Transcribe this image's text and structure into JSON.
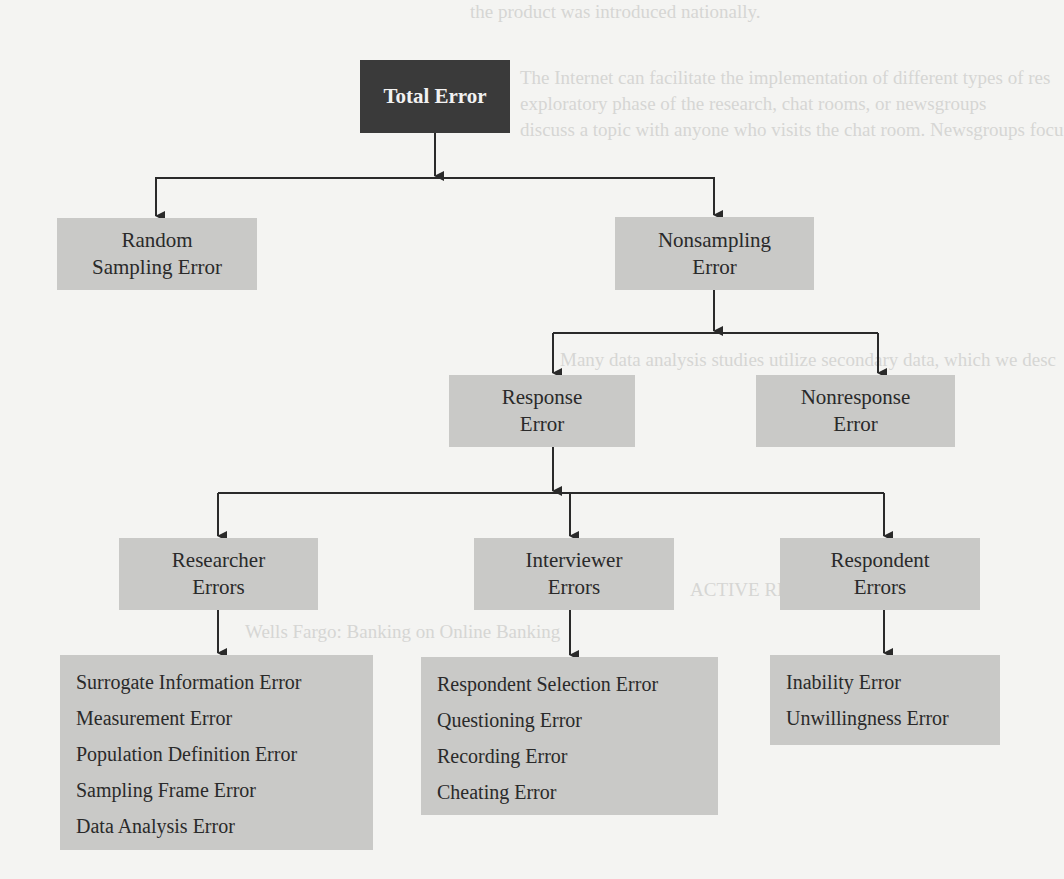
{
  "diagram": {
    "type": "hierarchy",
    "colors": {
      "root_fill": "#3a3a3a",
      "node_fill": "#c9c9c7",
      "line": "#2a2a2a",
      "background": "#f4f4f2"
    },
    "root": {
      "label": "Total Error"
    },
    "level1": [
      {
        "line1": "Random",
        "line2": "Sampling Error"
      },
      {
        "line1": "Nonsampling",
        "line2": "Error"
      }
    ],
    "level2": [
      {
        "line1": "Response",
        "line2": "Error"
      },
      {
        "line1": "Nonresponse",
        "line2": "Error"
      }
    ],
    "level3": [
      {
        "line1": "Researcher",
        "line2": "Errors"
      },
      {
        "line1": "Interviewer",
        "line2": "Errors"
      },
      {
        "line1": "Respondent",
        "line2": "Errors"
      }
    ],
    "lists": {
      "researcher": [
        "Surrogate Information Error",
        "Measurement Error",
        "Population Definition Error",
        "Sampling Frame Error",
        "Data Analysis Error"
      ],
      "interviewer": [
        "Respondent Selection Error",
        "Questioning Error",
        "Recording Error",
        "Cheating Error"
      ],
      "respondent": [
        "Inability Error",
        "Unwillingness Error"
      ]
    }
  },
  "background_text": {
    "lines": [
      "the product was introduced nationally.",
      "The Internet can facilitate the implementation of different types of res",
      "exploratory phase of the research, chat rooms, or newsgroups",
      "discuss a topic with anyone who visits the chat room. Newsgroups focu",
      "Many data analysis studies utilize secondary data, which we desc",
      "ACTIVE RESEARCH",
      "Wells Fargo: Banking on Online Banking"
    ]
  }
}
